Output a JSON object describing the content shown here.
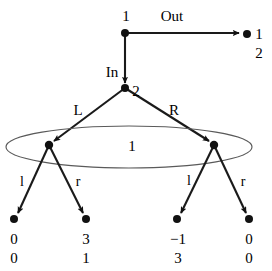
{
  "figure": {
    "type": "extensive-form-game-tree",
    "nodes": {
      "root": {
        "player_label": "1",
        "x": 125,
        "y": 33
      },
      "second": {
        "player_label": "2",
        "x": 125,
        "y": 88
      },
      "infoset_left": {
        "x": 49,
        "y": 145
      },
      "infoset_right": {
        "x": 214,
        "y": 145
      }
    },
    "edge_labels": {
      "out": "Out",
      "in": "In",
      "big_l": "L",
      "big_r": "R",
      "left_l": "l",
      "left_r": "r",
      "right_l": "l",
      "right_r": "r"
    },
    "information_set": {
      "player_label": "1",
      "center_x": 129,
      "center_y": 147,
      "rx": 123,
      "ry": 21
    },
    "terminals": [
      {
        "id": "out-terminal",
        "x": 247,
        "y": 34,
        "payoff_top": "1",
        "payoff_bottom": "2"
      },
      {
        "id": "l-left-terminal",
        "x": 14,
        "y": 219,
        "payoff_top": "0",
        "payoff_bottom": "0"
      },
      {
        "id": "r-left-terminal",
        "x": 86,
        "y": 219,
        "payoff_top": "3",
        "payoff_bottom": "1"
      },
      {
        "id": "l-right-terminal",
        "x": 177,
        "y": 219,
        "payoff_top": "−1",
        "payoff_bottom": "3"
      },
      {
        "id": "r-right-terminal",
        "x": 249,
        "y": 219,
        "payoff_top": "0",
        "payoff_bottom": "0"
      }
    ],
    "colors": {
      "line": "#1a1a1a",
      "node": "#111111",
      "oval": "#5a5a5a",
      "text": "#000000",
      "background": "#ffffff"
    }
  }
}
